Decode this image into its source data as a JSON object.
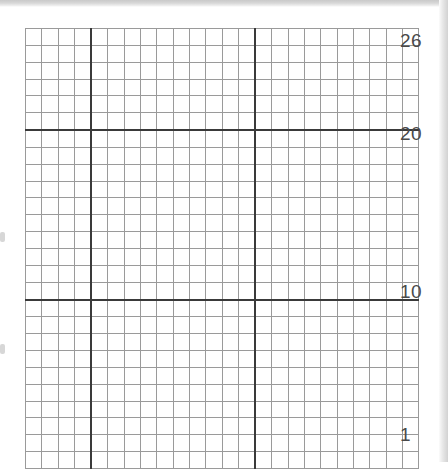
{
  "document": {
    "type": "cross-stitch-chart",
    "subject": "cherries",
    "grid": {
      "columns": 24,
      "rows": 26,
      "heavy_line_every": 10
    }
  },
  "axis": {
    "labels": [
      {
        "name": "row-label-26",
        "text": "26",
        "row": 26
      },
      {
        "name": "row-label-20",
        "text": "20",
        "row": 20
      },
      {
        "name": "row-label-10",
        "text": "10",
        "row": 10
      },
      {
        "name": "row-label-1",
        "text": "1",
        "row": 1
      }
    ]
  },
  "palette": {
    "empty": "#ffffff",
    "leaf": "#9d9d9d",
    "light": "#bdbdbd",
    "fruit": "#6e6e6e",
    "gridline": "#9a9a9a",
    "gridline_heavy": "#3a3a3a",
    "label_text": "#4a4a4a"
  },
  "legend_keys": [
    {
      "name": "key-leaf",
      "symbol": "leaf",
      "color": "#9d9d9d"
    },
    {
      "name": "key-light",
      "symbol": "light",
      "color": "#bdbdbd"
    },
    {
      "name": "key-fruit",
      "symbol": "fruit",
      "color": "#6e6e6e"
    }
  ],
  "chart_data": {
    "type": "heatmap",
    "title": "",
    "xlabel": "",
    "ylabel": "",
    "columns": 24,
    "rows": 26,
    "row_order": "top row = 26, bottom row = 1",
    "legend": [
      "empty",
      "leaf",
      "light",
      "fruit"
    ],
    "cell_codes": {
      "0": "empty",
      "1": "leaf",
      "2": "light",
      "3": "fruit"
    },
    "matrix": [
      [
        0,
        0,
        0,
        0,
        0,
        0,
        0,
        0,
        0,
        0,
        0,
        0,
        0,
        0,
        0,
        0,
        0,
        0,
        0,
        0,
        0,
        0,
        0,
        0
      ],
      [
        0,
        0,
        0,
        0,
        0,
        0,
        1,
        1,
        1,
        0,
        1,
        1,
        1,
        1,
        1,
        1,
        1,
        0,
        0,
        0,
        0,
        0,
        0,
        0
      ],
      [
        0,
        0,
        0,
        0,
        0,
        1,
        1,
        1,
        1,
        0,
        1,
        1,
        0,
        1,
        1,
        1,
        1,
        1,
        0,
        0,
        0,
        0,
        0,
        0
      ],
      [
        0,
        0,
        0,
        0,
        1,
        1,
        1,
        1,
        1,
        0,
        1,
        1,
        1,
        0,
        1,
        1,
        1,
        1,
        1,
        0,
        0,
        0,
        0,
        0
      ],
      [
        0,
        0,
        0,
        1,
        1,
        1,
        1,
        1,
        1,
        0,
        1,
        1,
        0,
        0,
        1,
        1,
        1,
        1,
        1,
        1,
        0,
        0,
        0,
        0
      ],
      [
        0,
        0,
        1,
        1,
        1,
        1,
        1,
        0,
        0,
        0,
        1,
        0,
        0,
        1,
        1,
        1,
        1,
        1,
        1,
        1,
        0,
        1,
        1,
        0
      ],
      [
        0,
        0,
        0,
        1,
        1,
        1,
        0,
        0,
        1,
        1,
        1,
        0,
        0,
        1,
        0,
        0,
        1,
        1,
        1,
        1,
        1,
        1,
        0,
        0
      ],
      [
        0,
        0,
        0,
        0,
        0,
        0,
        0,
        0,
        1,
        0,
        0,
        0,
        0,
        1,
        0,
        0,
        0,
        0,
        0,
        0,
        0,
        0,
        0,
        0
      ],
      [
        0,
        0,
        0,
        0,
        0,
        0,
        0,
        1,
        0,
        0,
        0,
        0,
        0,
        1,
        0,
        0,
        0,
        0,
        0,
        0,
        0,
        0,
        0,
        0
      ],
      [
        0,
        0,
        0,
        0,
        0,
        0,
        1,
        0,
        0,
        0,
        0,
        0,
        0,
        1,
        0,
        0,
        0,
        0,
        0,
        0,
        0,
        0,
        0,
        0
      ],
      [
        0,
        0,
        0,
        0,
        0,
        1,
        0,
        0,
        0,
        0,
        0,
        0,
        1,
        1,
        0,
        0,
        0,
        0,
        0,
        0,
        0,
        0,
        0,
        0
      ],
      [
        0,
        0,
        0,
        0,
        0,
        1,
        0,
        0,
        0,
        0,
        0,
        0,
        1,
        0,
        0,
        0,
        0,
        0,
        0,
        0,
        0,
        0,
        0,
        0
      ],
      [
        0,
        0,
        0,
        0,
        1,
        0,
        0,
        0,
        0,
        0,
        0,
        0,
        1,
        0,
        0,
        0,
        0,
        0,
        0,
        0,
        0,
        0,
        0,
        0
      ],
      [
        0,
        0,
        0,
        2,
        3,
        3,
        3,
        0,
        0,
        0,
        0,
        0,
        1,
        0,
        0,
        0,
        0,
        0,
        0,
        0,
        0,
        0,
        0,
        0
      ],
      [
        0,
        0,
        3,
        3,
        3,
        3,
        3,
        3,
        0,
        0,
        0,
        0,
        0,
        1,
        0,
        0,
        0,
        0,
        0,
        0,
        0,
        0,
        0,
        0
      ],
      [
        0,
        0,
        3,
        3,
        3,
        3,
        3,
        3,
        0,
        0,
        0,
        0,
        0,
        0,
        1,
        0,
        0,
        0,
        0,
        0,
        0,
        0,
        0,
        0
      ],
      [
        0,
        0,
        3,
        3,
        3,
        3,
        3,
        3,
        0,
        0,
        0,
        0,
        0,
        0,
        0,
        2,
        0,
        0,
        0,
        0,
        0,
        0,
        0,
        0
      ],
      [
        0,
        0,
        3,
        3,
        3,
        3,
        3,
        3,
        0,
        0,
        0,
        0,
        0,
        3,
        3,
        2,
        3,
        0,
        0,
        0,
        0,
        0,
        0,
        0
      ],
      [
        0,
        0,
        3,
        3,
        3,
        3,
        3,
        3,
        0,
        0,
        0,
        0,
        3,
        3,
        3,
        3,
        3,
        3,
        0,
        0,
        0,
        0,
        0,
        0
      ],
      [
        0,
        0,
        3,
        3,
        3,
        3,
        3,
        3,
        0,
        0,
        0,
        0,
        3,
        3,
        3,
        3,
        3,
        3,
        0,
        0,
        0,
        0,
        0,
        0
      ],
      [
        0,
        0,
        0,
        3,
        3,
        3,
        3,
        0,
        0,
        0,
        0,
        0,
        3,
        3,
        3,
        3,
        3,
        3,
        0,
        0,
        0,
        0,
        0,
        0
      ],
      [
        0,
        0,
        0,
        3,
        3,
        3,
        3,
        0,
        0,
        0,
        0,
        0,
        3,
        3,
        3,
        3,
        3,
        3,
        0,
        0,
        0,
        0,
        0,
        0
      ],
      [
        0,
        0,
        0,
        0,
        0,
        0,
        0,
        0,
        0,
        0,
        0,
        0,
        3,
        3,
        3,
        3,
        3,
        3,
        0,
        0,
        0,
        0,
        0,
        0
      ],
      [
        0,
        0,
        0,
        0,
        0,
        0,
        0,
        0,
        0,
        0,
        0,
        0,
        0,
        3,
        3,
        3,
        3,
        0,
        0,
        0,
        0,
        0,
        0,
        0
      ],
      [
        0,
        0,
        0,
        0,
        0,
        0,
        0,
        0,
        0,
        0,
        0,
        0,
        0,
        0,
        0,
        0,
        0,
        0,
        0,
        0,
        0,
        0,
        0,
        0
      ],
      [
        0,
        0,
        0,
        0,
        0,
        0,
        0,
        0,
        0,
        0,
        0,
        0,
        0,
        0,
        0,
        0,
        0,
        0,
        0,
        0,
        0,
        0,
        0,
        0
      ]
    ]
  }
}
